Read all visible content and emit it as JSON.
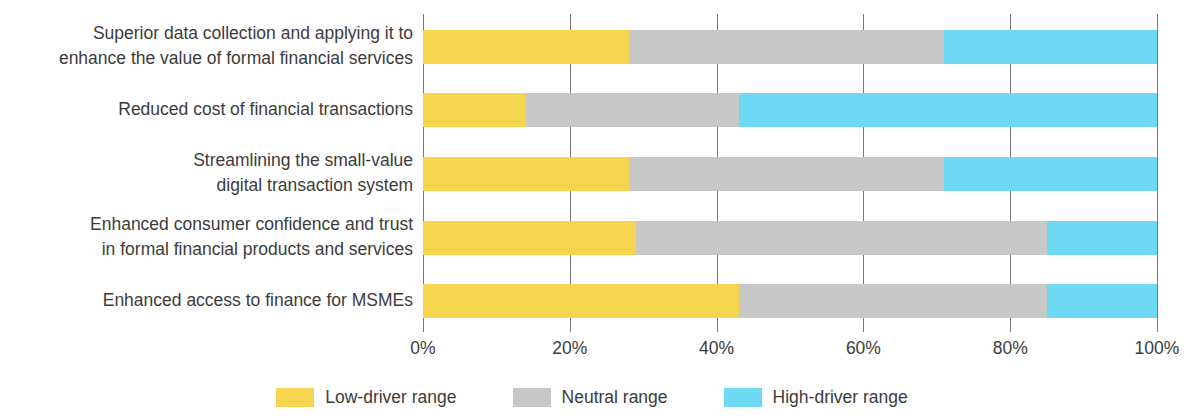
{
  "chart_data": {
    "type": "bar",
    "orientation": "horizontal",
    "stacked": true,
    "stack_mode": "percent",
    "title": "",
    "subtitle": "",
    "xlabel": "",
    "ylabel": "",
    "xlim": [
      0,
      100
    ],
    "grid": true,
    "grid_axis": "x",
    "legend_position": "bottom",
    "xticks": [
      0,
      20,
      40,
      60,
      80,
      100
    ],
    "xtick_labels": [
      "0%",
      "20%",
      "40%",
      "60%",
      "80%",
      "100%"
    ],
    "categories": [
      "Superior data collection and applying it to\nenhance the value of formal financial services",
      "Reduced cost of financial transactions",
      "Streamlining the small-value\ndigital transaction system",
      "Enhanced consumer confidence and trust\nin formal financial products and services",
      "Enhanced access to finance for MSMEs"
    ],
    "series": [
      {
        "name": "Low-driver range",
        "color": "#f5d44f",
        "values": [
          28,
          14,
          28,
          29,
          43
        ]
      },
      {
        "name": "Neutral range",
        "color": "#c8c8c7",
        "values": [
          43,
          29,
          43,
          56,
          42
        ]
      },
      {
        "name": "High-driver range",
        "color": "#6dd9f2",
        "values": [
          29,
          57,
          29,
          15,
          15
        ]
      }
    ],
    "legend": [
      {
        "label": "Low-driver range",
        "color": "#f5d44f"
      },
      {
        "label": "Neutral range",
        "color": "#c8c8c7"
      },
      {
        "label": "High-driver range",
        "color": "#6dd9f2"
      }
    ],
    "colors": {
      "low": "#f5d44f",
      "neutral": "#c8c8c7",
      "high": "#6dd9f2",
      "gridline": "#7a7a7a",
      "text": "#3c3c3b",
      "background": "#ffffff"
    }
  }
}
